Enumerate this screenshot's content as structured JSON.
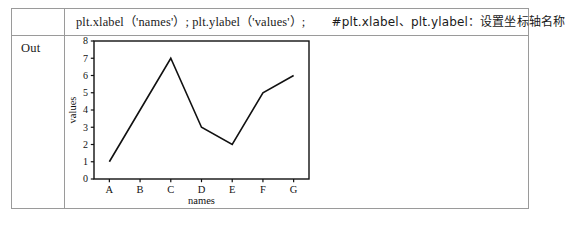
{
  "table": {
    "out_label": "Out",
    "code_row": {
      "statement": "plt.xlabel（'names'）; plt.ylabel（'values'）;",
      "comment": "#plt.xlabel、plt.ylabel：设置坐标轴名称"
    }
  },
  "chart_data": {
    "type": "line",
    "title": "",
    "categories": [
      "A",
      "B",
      "C",
      "D",
      "E",
      "F",
      "G"
    ],
    "values": [
      1,
      4,
      7,
      3,
      2,
      5,
      6
    ],
    "series": [
      {
        "name": "values",
        "values": [
          1,
          4,
          7,
          3,
          2,
          5,
          6
        ]
      }
    ],
    "xlabel": "names",
    "ylabel": "values",
    "ylim": [
      0,
      8
    ],
    "ytick_labels": [
      "0",
      "1",
      "2",
      "3",
      "4",
      "5",
      "6",
      "7",
      "8"
    ],
    "yticks": [
      0,
      1,
      2,
      3,
      4,
      5,
      6,
      7,
      8
    ],
    "xtick_labels": [
      "A",
      "B",
      "C",
      "D",
      "E",
      "F",
      "G"
    ],
    "grid": false,
    "legend": "none",
    "line_color": "#111111",
    "line_width": 1.6,
    "axes_color": "#111111",
    "background": "#ffffff"
  }
}
